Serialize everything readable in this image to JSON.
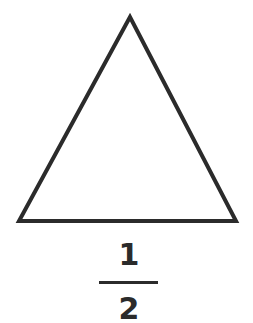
{
  "diagram": {
    "shape": "triangle",
    "stroke_color": "#2b2b2b",
    "vertices": [
      [
        130,
        17
      ],
      [
        19,
        221
      ],
      [
        236,
        221
      ]
    ]
  },
  "fraction": {
    "numerator": "1",
    "denominator": "2",
    "color": "#2b2b2b"
  }
}
